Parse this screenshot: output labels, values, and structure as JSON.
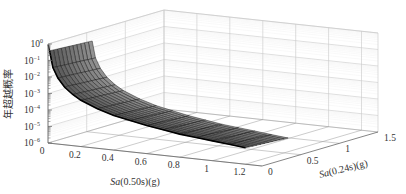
{
  "chart_data": {
    "type": "surface3d",
    "title": "",
    "zlabel": "年超越概率",
    "xlabel": "Sa(0.50s)(g)",
    "ylabel": "Sa(0.24s)(g)",
    "xlabel_italic": "Sa",
    "xlabel_rest": "(0.50s)(g)",
    "ylabel_italic": "Sa",
    "ylabel_rest": "(0.24s)(g)",
    "x_ticks": [
      "0",
      "0.2",
      "0.4",
      "0.6",
      "0.8",
      "1",
      "1.2"
    ],
    "x_tick_values": [
      0,
      0.2,
      0.4,
      0.6,
      0.8,
      1.0,
      1.2
    ],
    "y_ticks": [
      "0",
      "0.5",
      "1",
      "1.5"
    ],
    "y_tick_values": [
      0,
      0.5,
      1.0,
      1.5
    ],
    "z_ticks": [
      "10^0",
      "10^-1",
      "10^-2",
      "10^-3",
      "10^-4",
      "10^-5",
      "10^-6"
    ],
    "z_tick_exponents": [
      0,
      -1,
      -2,
      -3,
      -4,
      -5,
      -6
    ],
    "xlim": [
      0,
      1.3
    ],
    "ylim": [
      0,
      1.5
    ],
    "zlim_log10": [
      -6,
      0
    ],
    "grid": true,
    "surface": {
      "x_range": [
        0.01,
        1.2
      ],
      "y_range": [
        0.0,
        0.55
      ],
      "description": "Annual exceedance probability surface decaying steeply from ~10^-1 near Sa(0.50s)=0 to ~10^-5 at Sa(0.50s)=1.2; nearly flat along Sa(0.24s)",
      "x_samples": [
        0.01,
        0.03,
        0.06,
        0.1,
        0.15,
        0.2,
        0.3,
        0.4,
        0.5,
        0.6,
        0.7,
        0.8,
        0.9,
        1.0,
        1.1,
        1.2
      ],
      "log10_z_at_y0": [
        -0.4,
        -1.4,
        -2.0,
        -2.5,
        -2.9,
        -3.2,
        -3.6,
        -3.9,
        -4.1,
        -4.3,
        -4.45,
        -4.6,
        -4.7,
        -4.8,
        -4.9,
        -5.0
      ],
      "y_samples": [
        0.0,
        0.05,
        0.1,
        0.15,
        0.2,
        0.25,
        0.3,
        0.35,
        0.4,
        0.45,
        0.5,
        0.55
      ],
      "log10_z_y_offset_per_unit": -0.3
    },
    "colors": {
      "surface_line": "#111111",
      "surface_fill": "#555555",
      "grid": "#c8c8c8",
      "axis": "#666666"
    }
  }
}
